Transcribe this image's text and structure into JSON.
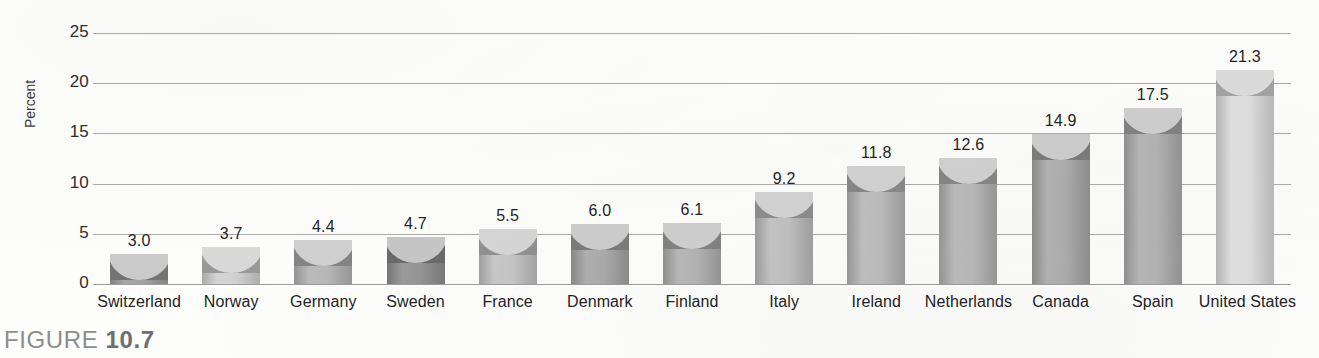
{
  "caption": {
    "prefix": "FIGURE ",
    "number": "10.7"
  },
  "axis": {
    "ylabel": "Percent",
    "yticks": [
      "0",
      "5",
      "10",
      "15",
      "20",
      "25"
    ]
  },
  "chart_data": {
    "type": "bar",
    "title": "",
    "xlabel": "",
    "ylabel": "Percent",
    "ylim": [
      0,
      25
    ],
    "ytick_values": [
      0,
      5,
      10,
      15,
      20,
      25
    ],
    "grid": true,
    "legend": false,
    "categories": [
      "Switzerland",
      "Norway",
      "Germany",
      "Sweden",
      "France",
      "Denmark",
      "Finland",
      "Italy",
      "Ireland",
      "Netherlands",
      "Canada",
      "Spain",
      "United States"
    ],
    "values": [
      3.0,
      3.7,
      4.4,
      4.7,
      5.5,
      6.0,
      6.1,
      9.2,
      11.8,
      12.6,
      14.9,
      17.5,
      21.3
    ],
    "value_labels": [
      "3.0",
      "3.7",
      "4.4",
      "4.7",
      "5.5",
      "6.0",
      "6.1",
      "9.2",
      "11.8",
      "12.6",
      "14.9",
      "17.5",
      "21.3"
    ],
    "bar_colors": [
      "#9d9d9d",
      "#cfcfcf",
      "#b3b3b3",
      "#8f8f8f",
      "#c2c2c2",
      "#a6a6a6",
      "#b0b0b0",
      "#bdbdbd",
      "#b8b8b8",
      "#b5b5b5",
      "#a9a9a9",
      "#afafaf",
      "#dcdcdc"
    ]
  },
  "colors": {
    "gridline": "#9b9b9b",
    "text": "#232323",
    "caption": "#8d8d8d",
    "background": "#fdfdfc"
  }
}
